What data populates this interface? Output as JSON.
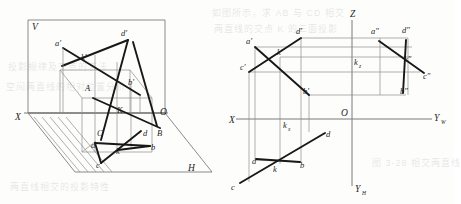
{
  "figure": {
    "colors": {
      "thick_line": "#181818",
      "thin_line": "#8d8d90",
      "axis_line": "#7a7a7d",
      "background": "#fdfdfc"
    }
  },
  "left_view": {
    "name": "pictorial-two-plane-view",
    "plane_labels": [
      {
        "id": "V",
        "text": "V",
        "x": 32,
        "y": 27
      },
      {
        "id": "H",
        "text": "H",
        "x": 188,
        "y": 168
      },
      {
        "id": "X",
        "text": "X",
        "x": 15,
        "y": 117
      },
      {
        "id": "O",
        "text": "O",
        "x": 160,
        "y": 112
      }
    ],
    "point_labels": [
      {
        "id": "a-prime",
        "text": "a′",
        "x": 57,
        "y": 45
      },
      {
        "id": "d-prime",
        "text": "d′",
        "x": 122,
        "y": 35
      },
      {
        "id": "k-prime",
        "text": "k′",
        "x": 82,
        "y": 58
      },
      {
        "id": "b-prime",
        "text": "b′",
        "x": 129,
        "y": 83
      },
      {
        "id": "A",
        "text": "A",
        "x": 86,
        "y": 89
      },
      {
        "id": "B",
        "text": "B",
        "x": 158,
        "y": 134
      },
      {
        "id": "C",
        "text": "C",
        "x": 98,
        "y": 134
      },
      {
        "id": "K",
        "text": "K",
        "x": 118,
        "y": 111
      },
      {
        "id": "a",
        "text": "a",
        "x": 92,
        "y": 146
      },
      {
        "id": "b",
        "text": "b",
        "x": 152,
        "y": 148
      },
      {
        "id": "c",
        "text": "c",
        "x": 97,
        "y": 166
      },
      {
        "id": "d",
        "text": "d",
        "x": 144,
        "y": 134
      },
      {
        "id": "k",
        "text": "k",
        "x": 117,
        "y": 152
      }
    ]
  },
  "right_view": {
    "name": "three-view-orthographic-projection",
    "axis_labels": [
      {
        "id": "X",
        "text": "X",
        "x": 230,
        "y": 121
      },
      {
        "id": "Z",
        "text": "Z",
        "x": 352,
        "y": 14
      },
      {
        "id": "O",
        "text": "O",
        "x": 344,
        "y": 119
      },
      {
        "id": "Y-W",
        "base": "Y",
        "sub": "W",
        "x": 435,
        "y": 119
      },
      {
        "id": "Y-H",
        "base": "Y",
        "sub": "H",
        "x": 357,
        "y": 189
      }
    ],
    "point_labels": [
      {
        "id": "a-prime",
        "text": "a′",
        "x": 251,
        "y": 44
      },
      {
        "id": "d-prime",
        "text": "d′",
        "x": 297,
        "y": 33
      },
      {
        "id": "k-prime",
        "text": "k′",
        "x": 280,
        "y": 55
      },
      {
        "id": "c-prime",
        "text": "c′",
        "x": 244,
        "y": 69
      },
      {
        "id": "b-prime",
        "text": "b′",
        "x": 304,
        "y": 93
      },
      {
        "id": "a-dblprime",
        "text": "a″",
        "x": 373,
        "y": 33
      },
      {
        "id": "d-dblprime",
        "text": "d″",
        "x": 404,
        "y": 32
      },
      {
        "id": "k-dblprime",
        "text": "k″",
        "x": 404,
        "y": 60
      },
      {
        "id": "c-dblprime",
        "text": "c″",
        "x": 424,
        "y": 78
      },
      {
        "id": "b-dblprime",
        "text": "b″",
        "x": 402,
        "y": 92
      },
      {
        "id": "a",
        "text": "a",
        "x": 255,
        "y": 163
      },
      {
        "id": "b",
        "text": "b",
        "x": 302,
        "y": 166
      },
      {
        "id": "c",
        "text": "c",
        "x": 233,
        "y": 188
      },
      {
        "id": "d",
        "text": "d",
        "x": 327,
        "y": 137
      },
      {
        "id": "k",
        "text": "k",
        "x": 275,
        "y": 171
      }
    ],
    "subscript_labels": [
      {
        "id": "k-x",
        "base": "k",
        "sub": "x",
        "x": 285,
        "y": 126
      },
      {
        "id": "k-z",
        "base": "k",
        "sub": "z",
        "x": 355,
        "y": 63
      }
    ]
  },
  "background_text": {
    "lines": [
      {
        "text": "如图所示，求 AB 与 CD 相交",
        "x": 212,
        "y": 6
      },
      {
        "text": "两直线的交点 K 的三面投影",
        "x": 214,
        "y": 22
      },
      {
        "text": "投影规律及交点的求法",
        "x": 8,
        "y": 60
      },
      {
        "text": "空间两直线的相对位置分析",
        "x": 6,
        "y": 80
      },
      {
        "text": "图 3-28 相交两直线",
        "x": 372,
        "y": 156
      },
      {
        "text": "两直线相交的投影特性",
        "x": 10,
        "y": 180
      }
    ]
  }
}
